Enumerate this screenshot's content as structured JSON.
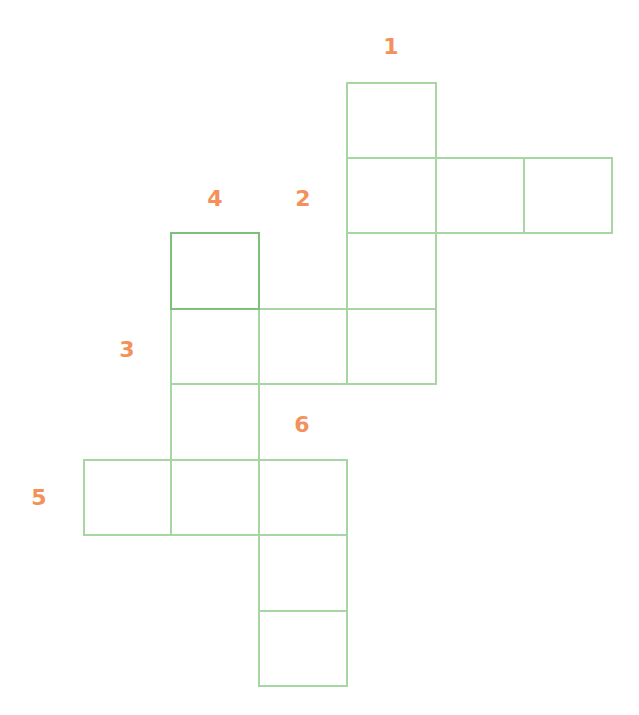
{
  "puzzle": {
    "type": "crossword",
    "colors": {
      "grid_line": "#a6d7a3",
      "grid_line_emphasis": "#7fbf7c",
      "clue_number": "#f4915a",
      "background": "#ffffff"
    },
    "clue_numbers": [
      {
        "label": "1",
        "direction": "down"
      },
      {
        "label": "2",
        "direction": "across"
      },
      {
        "label": "3",
        "direction": "across"
      },
      {
        "label": "4",
        "direction": "down"
      },
      {
        "label": "5",
        "direction": "across"
      },
      {
        "label": "6",
        "direction": "down"
      }
    ],
    "cells": [
      {
        "row": 0,
        "col": 4,
        "value": ""
      },
      {
        "row": 1,
        "col": 4,
        "value": ""
      },
      {
        "row": 1,
        "col": 5,
        "value": ""
      },
      {
        "row": 1,
        "col": 6,
        "value": ""
      },
      {
        "row": 2,
        "col": 2,
        "value": "",
        "emphasis": true
      },
      {
        "row": 2,
        "col": 4,
        "value": ""
      },
      {
        "row": 3,
        "col": 2,
        "value": ""
      },
      {
        "row": 3,
        "col": 3,
        "value": ""
      },
      {
        "row": 3,
        "col": 4,
        "value": ""
      },
      {
        "row": 4,
        "col": 2,
        "value": ""
      },
      {
        "row": 5,
        "col": 1,
        "value": ""
      },
      {
        "row": 5,
        "col": 2,
        "value": ""
      },
      {
        "row": 5,
        "col": 3,
        "value": ""
      },
      {
        "row": 6,
        "col": 3,
        "value": ""
      },
      {
        "row": 7,
        "col": 3,
        "value": ""
      }
    ]
  }
}
